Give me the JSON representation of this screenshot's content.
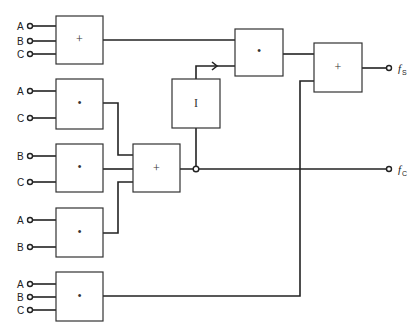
{
  "diagram": {
    "type": "logic-circuit",
    "gates": [
      {
        "id": "g1",
        "op_symbol": "+",
        "kind": "OR",
        "inputs": [
          "A",
          "B",
          "C"
        ]
      },
      {
        "id": "g2",
        "op_symbol": "•",
        "kind": "AND",
        "inputs": [
          "A",
          "C"
        ]
      },
      {
        "id": "g3",
        "op_symbol": "•",
        "kind": "AND",
        "inputs": [
          "B",
          "C"
        ]
      },
      {
        "id": "g4",
        "op_symbol": "•",
        "kind": "AND",
        "inputs": [
          "A",
          "B"
        ]
      },
      {
        "id": "g5",
        "op_symbol": "•",
        "kind": "AND",
        "inputs": [
          "A",
          "B",
          "C"
        ]
      },
      {
        "id": "g6",
        "op_symbol": "+",
        "kind": "OR",
        "inputs": [
          "g2",
          "g3",
          "g4"
        ]
      },
      {
        "id": "g7",
        "op_symbol": "I",
        "kind": "INVERTER",
        "inputs": [
          "g6"
        ]
      },
      {
        "id": "g8",
        "op_symbol": "•",
        "kind": "AND",
        "inputs": [
          "g1",
          "g7"
        ]
      },
      {
        "id": "g9",
        "op_symbol": "+",
        "kind": "OR",
        "inputs": [
          "g8",
          "g5"
        ]
      }
    ],
    "input_labels": {
      "g1": [
        "A",
        "B",
        "C"
      ],
      "g2": [
        "A",
        "C"
      ],
      "g3": [
        "B",
        "C"
      ],
      "g4": [
        "A",
        "B"
      ],
      "g5": [
        "A",
        "B",
        "C"
      ]
    },
    "outputs": [
      {
        "name": "f",
        "subscript": "S",
        "source": "g9"
      },
      {
        "name": "f",
        "subscript": "C",
        "source": "g6"
      }
    ]
  }
}
